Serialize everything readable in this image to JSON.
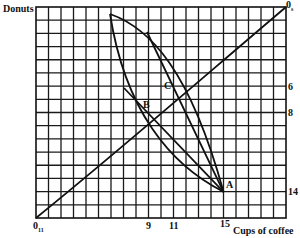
{
  "diagram": {
    "type": "edgeworth_box",
    "grid": {
      "columns": 20,
      "rows": 16,
      "color": "#1a1a1a"
    },
    "axes": {
      "vertical_label": "Donuts",
      "horizontal_label": "Cups of coffee",
      "origin_bottom_left": "0",
      "origin_bottom_left_sub": "11",
      "origin_top_right": "0",
      "origin_top_right_sub": "s"
    },
    "x_ticks": [
      {
        "value": 9,
        "label": "9"
      },
      {
        "value": 11,
        "label": "11"
      },
      {
        "value": 15,
        "label": "15"
      }
    ],
    "y_ticks_right": [
      {
        "value": 6,
        "label": "6"
      },
      {
        "value": 8,
        "label": "8"
      },
      {
        "value": 14,
        "label": "14"
      }
    ],
    "points": [
      {
        "name": "A",
        "coffee": 15,
        "donuts_from_top": 14
      },
      {
        "name": "B",
        "coffee": 9,
        "donuts_from_top": 8
      },
      {
        "name": "C",
        "coffee": 11,
        "donuts_from_top": 6
      }
    ],
    "curves": [
      "contract curve from bottom-left origin to top-right origin",
      "indifference curve (upper arc) through C to A",
      "indifference curve (lower arc) through B to A",
      "straight price line through B to A",
      "straight price line through C to A"
    ]
  }
}
